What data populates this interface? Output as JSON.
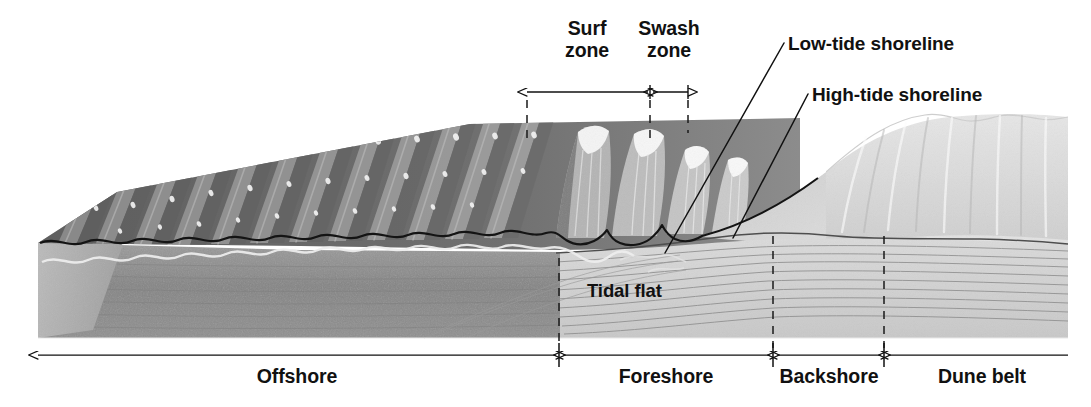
{
  "figure": {
    "background_color": "#ffffff",
    "width": 1091,
    "height": 407
  },
  "zone_headers": [
    {
      "id": "surf-zone",
      "line1": "Surf",
      "line2": "zone",
      "x": 587,
      "y": 18
    },
    {
      "id": "swash-zone",
      "line1": "Swash",
      "line2": "zone",
      "x": 669,
      "y": 18
    }
  ],
  "callouts": [
    {
      "id": "low-tide-shoreline",
      "text": "Low-tide shoreline",
      "x": 788,
      "y": 33
    },
    {
      "id": "high-tide-shoreline",
      "text": "High-tide shoreline",
      "x": 812,
      "y": 84
    }
  ],
  "inner_labels": [
    {
      "id": "tidal-flat",
      "text": "Tidal flat",
      "x": 587,
      "y": 281
    }
  ],
  "axis_zones": [
    {
      "id": "offshore",
      "label": "Offshore",
      "start": 38,
      "end": 556,
      "label_x": 297,
      "label_y": 374
    },
    {
      "id": "foreshore",
      "label": "Foreshore",
      "start": 563,
      "end": 770,
      "label_x": 666,
      "label_y": 374
    },
    {
      "id": "backshore",
      "label": "Backshore",
      "start": 777,
      "end": 881,
      "label_x": 829,
      "label_y": 374
    },
    {
      "id": "dune-belt",
      "label": "Dune belt",
      "start": 888,
      "end": 1068,
      "label_x": 982,
      "label_y": 374
    }
  ],
  "dimension_arrows": [
    {
      "id": "surf-zone-extent",
      "start": 527,
      "end": 648,
      "y": 92
    },
    {
      "id": "swash-zone-extent",
      "start": 652,
      "end": 688,
      "y": 92
    }
  ],
  "colors": {
    "ink": "#111111",
    "deep_water": "#6f6f6f",
    "water_crest": "#9c9c9c",
    "foam": "#efefef",
    "wet_sand": "#b9b9b9",
    "dry_sand": "#d6d6d6",
    "dune": "#dedede",
    "substrate": "#8d8d8d",
    "strata_line": "#8a8a8a",
    "outline": "#1a1a1a"
  },
  "icons": {
    "arrow_left": "arrow-left-icon",
    "arrow_right": "arrow-right-icon",
    "leader_line": "leader-line-icon",
    "dashed_guide": "dashed-guide-icon"
  }
}
